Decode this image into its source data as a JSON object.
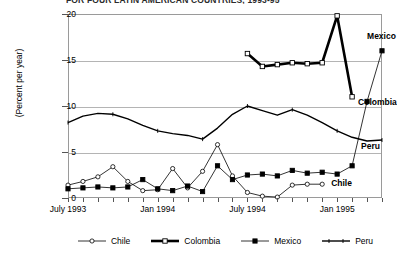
{
  "title": "FOR FOUR LATIN AMERICAN COUNTRIES, 1993-95",
  "chart_data": {
    "type": "line",
    "title": "FOR FOUR LATIN AMERICAN COUNTRIES, 1993-95",
    "xlabel": "",
    "ylabel": "(Percent per year)",
    "ylim": [
      0,
      20
    ],
    "yticks": [
      0,
      5,
      10,
      15,
      20
    ],
    "ytick_labels": [
      "0",
      "5",
      "10",
      "15",
      "20"
    ],
    "xlim": [
      "1993-07",
      "1995-04"
    ],
    "xtick_labels": [
      "July 1993",
      "Jan 1994",
      "July 1994",
      "Jan 1995"
    ],
    "xtick_positions": [
      0,
      6,
      12,
      18
    ],
    "grid": true,
    "legend_position": "bottom",
    "x_months": [
      0,
      1,
      2,
      3,
      4,
      5,
      6,
      7,
      8,
      9,
      10,
      11,
      12,
      13,
      14,
      15,
      16,
      17,
      18,
      19,
      20,
      21
    ],
    "series": [
      {
        "name": "Chile",
        "marker": "open-circle",
        "color": "#000000",
        "line_width": 0.8,
        "x": [
          0,
          1,
          2,
          3,
          4,
          5,
          6,
          7,
          8,
          9,
          10,
          11,
          12,
          13,
          14,
          15,
          16,
          17
        ],
        "values": [
          1.4,
          1.8,
          2.3,
          3.4,
          1.8,
          0.8,
          0.9,
          3.2,
          1.1,
          2.9,
          5.8,
          2.4,
          0.6,
          0.2,
          0.1,
          1.4,
          1.5,
          1.5
        ],
        "label_text": "Chile",
        "label_x": 17.6,
        "label_y": 1.6
      },
      {
        "name": "Colombia",
        "marker": "open-square",
        "color": "#000000",
        "line_width": 2.6,
        "x": [
          12,
          13,
          14,
          15,
          16,
          17,
          18,
          19
        ],
        "values": [
          15.7,
          14.3,
          14.5,
          14.7,
          14.6,
          14.7,
          19.8,
          11.0
        ],
        "label_text": "Colombia",
        "label_x": 19.4,
        "label_y": 10.4
      },
      {
        "name": "Mexico",
        "marker": "filled-square",
        "color": "#000000",
        "line_width": 0.8,
        "x": [
          0,
          1,
          2,
          3,
          4,
          5,
          6,
          7,
          8,
          9,
          10,
          11,
          12,
          13,
          14,
          15,
          16,
          17,
          18,
          19,
          20,
          21
        ],
        "values": [
          1.0,
          1.1,
          1.2,
          1.1,
          1.2,
          2.0,
          1.0,
          0.8,
          1.3,
          0.7,
          3.5,
          2.0,
          2.5,
          2.6,
          2.4,
          3.0,
          2.7,
          2.8,
          2.6,
          3.5,
          10.5,
          16.0
        ],
        "label_text": "Mexico",
        "label_x": 20.0,
        "label_y": 17.6
      },
      {
        "name": "Peru",
        "marker": "none",
        "color": "#000000",
        "line_width": 1.4,
        "x": [
          0,
          1,
          2,
          3,
          4,
          5,
          6,
          7,
          8,
          9,
          10,
          11,
          12,
          13,
          14,
          15,
          16,
          17,
          18,
          19,
          20,
          21
        ],
        "values": [
          8.2,
          8.9,
          9.2,
          9.1,
          8.6,
          7.9,
          7.3,
          7.0,
          6.8,
          6.4,
          7.6,
          9.1,
          10.0,
          9.5,
          9.0,
          9.6,
          9.0,
          8.2,
          7.3,
          6.6,
          6.2,
          6.3
        ],
        "label_text": "Peru",
        "label_x": 19.6,
        "label_y": 5.6
      }
    ],
    "legend": [
      {
        "name": "Chile",
        "marker": "open-circle",
        "line_width": 0.8
      },
      {
        "name": "Colombia",
        "marker": "open-square",
        "line_width": 2.6
      },
      {
        "name": "Mexico",
        "marker": "filled-square",
        "line_width": 0.8
      },
      {
        "name": "Peru",
        "marker": "none",
        "line_width": 1.4
      }
    ]
  }
}
